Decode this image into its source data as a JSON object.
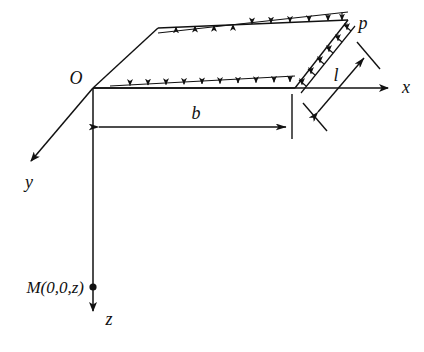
{
  "figure": {
    "kind": "engineering-diagram",
    "background_color": "#ffffff",
    "line_color": "#111111"
  },
  "axes": {
    "origin_label": "O",
    "x_label": "x",
    "y_label": "y",
    "z_label": "z"
  },
  "labels": {
    "load_intensity": "p",
    "width_dimension": "b",
    "length_dimension": "l",
    "field_point": "M(0,0,z)"
  },
  "geometry": {
    "origin": [
      93,
      88
    ],
    "x_axis_tip": [
      393,
      88
    ],
    "y_axis_tip": [
      25,
      167
    ],
    "z_axis_tip": [
      93,
      318
    ],
    "plate_corners": [
      [
        93,
        88
      ],
      [
        158,
        28
      ],
      [
        348,
        20
      ],
      [
        295,
        88
      ]
    ],
    "field_point_marker": [
      93,
      287
    ],
    "b_dim_line_y": 127,
    "b_dim_from_x": 96,
    "b_dim_to_x": 289,
    "l_dim_from": [
      313,
      118
    ],
    "l_dim_to": [
      369,
      52
    ],
    "top_edge_arrow_count": 11,
    "bottom_edge_arrow_count": 10,
    "right_edge_arrow_count": 6
  }
}
